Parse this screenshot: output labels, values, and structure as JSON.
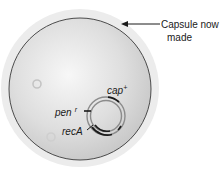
{
  "figure": {
    "callout": {
      "line1": "Capsule now",
      "line2": "made"
    },
    "plasmid_labels": {
      "cap": "cap",
      "cap_sup": "+",
      "pen": "pen",
      "pen_sup": "r",
      "reca": "recA"
    },
    "colors": {
      "capsule": "#ededed",
      "cell_fill_center": "#f6f6f6",
      "cell_fill_edge": "#c9c9c9",
      "cell_outline": "#3a3a3a",
      "plasmid_ring": "#8a8a8a",
      "gene_mark": "#1a1a1a"
    }
  }
}
